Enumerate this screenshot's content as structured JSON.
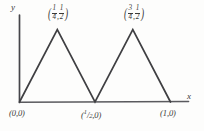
{
  "figure": {
    "kind": "hand-drawn-graph",
    "background_color": "#fdfdfc",
    "stroke_color": "#3a3a38",
    "axis_x_label": "x",
    "axis_y_label": "y"
  },
  "labels": {
    "origin": "(0,0)",
    "midpoint": "(1/2,0)",
    "endpoint": "(1,0)",
    "peak1_x_num": "1",
    "peak1_x_den": "4",
    "peak1_y_num": "1",
    "peak1_y_den": "2",
    "peak2_x_num": "3",
    "peak2_x_den": "4",
    "peak2_y_num": "1",
    "peak2_y_den": "2",
    "open_paren": "(",
    "close_paren": ")",
    "comma": ",",
    "mid_half_num": "1",
    "mid_half_den": "2"
  },
  "chart_data": {
    "type": "line",
    "title": "",
    "xlabel": "x",
    "ylabel": "y",
    "xlim": [
      0,
      1.12
    ],
    "ylim": [
      0,
      0.6
    ],
    "grid": false,
    "legend": "none",
    "series": [
      {
        "name": "triangular wave",
        "x": [
          0,
          0.25,
          0.5,
          0.75,
          1.0
        ],
        "y": [
          0,
          0.5,
          0,
          0.5,
          0
        ]
      }
    ],
    "annotations": [
      {
        "text": "(1/4, 1/2)",
        "x": 0.25,
        "y": 0.5,
        "position": "above"
      },
      {
        "text": "(3/4, 1/2)",
        "x": 0.75,
        "y": 0.5,
        "position": "above"
      },
      {
        "text": "(0,0)",
        "x": 0,
        "y": 0,
        "position": "below"
      },
      {
        "text": "(1/2,0)",
        "x": 0.5,
        "y": 0,
        "position": "below"
      },
      {
        "text": "(1,0)",
        "x": 1.0,
        "y": 0,
        "position": "below"
      }
    ],
    "x_tick_labels": [
      "(0,0)",
      "(1/2,0)",
      "(1,0)"
    ],
    "y_tick_labels": []
  }
}
